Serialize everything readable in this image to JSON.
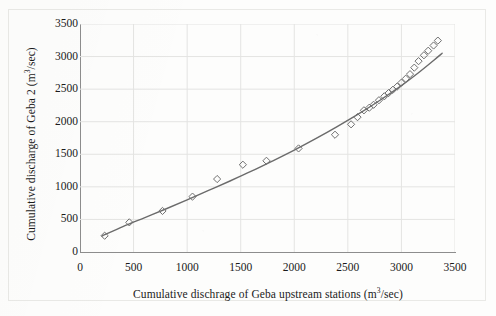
{
  "chart_data": {
    "type": "scatter",
    "title": "",
    "xlabel": "Cumulative dischrage of Geba upstream stations (m3/sec)",
    "ylabel": "Cumulative discharge of Geba 2  (m3/sec)",
    "xlabel_parts": {
      "pre": "Cumulative dischrage of Geba upstream stations (m",
      "sup": "3",
      "post": "/sec)"
    },
    "ylabel_parts": {
      "pre": "Cumulative discharge of Geba 2  (m",
      "sup": "3",
      "post": "/sec)"
    },
    "xlim": [
      0,
      3500
    ],
    "ylim": [
      0,
      3500
    ],
    "xticks": [
      0,
      500,
      1000,
      1500,
      2000,
      2500,
      3000,
      3500
    ],
    "yticks": [
      0,
      500,
      1000,
      1500,
      2000,
      2500,
      3000,
      3500
    ],
    "grid": true,
    "legend": "none",
    "marker": "open-diamond",
    "marker_color": "#6f6f6f",
    "line_color": "#6b6b6b",
    "series": [
      {
        "name": "Double mass points",
        "marker": "open-diamond",
        "points": [
          [
            230,
            250
          ],
          [
            460,
            455
          ],
          [
            770,
            630
          ],
          [
            1050,
            850
          ],
          [
            1280,
            1120
          ],
          [
            1520,
            1340
          ],
          [
            1740,
            1400
          ],
          [
            2040,
            1590
          ],
          [
            2380,
            1800
          ],
          [
            2530,
            1960
          ],
          [
            2590,
            2070
          ],
          [
            2650,
            2175
          ],
          [
            2700,
            2215
          ],
          [
            2740,
            2260
          ],
          [
            2790,
            2330
          ],
          [
            2840,
            2390
          ],
          [
            2880,
            2440
          ],
          [
            2920,
            2490
          ],
          [
            2960,
            2540
          ],
          [
            3000,
            2600
          ],
          [
            3040,
            2660
          ],
          [
            3080,
            2730
          ],
          [
            3120,
            2830
          ],
          [
            3160,
            2930
          ],
          [
            3210,
            3020
          ],
          [
            3250,
            3090
          ],
          [
            3300,
            3170
          ],
          [
            3340,
            3245
          ]
        ]
      },
      {
        "name": "Fitted trend curve",
        "type": "line",
        "points": [
          [
            205,
            245
          ],
          [
            400,
            390
          ],
          [
            600,
            525
          ],
          [
            800,
            660
          ],
          [
            1000,
            800
          ],
          [
            1200,
            945
          ],
          [
            1400,
            1090
          ],
          [
            1600,
            1240
          ],
          [
            1800,
            1400
          ],
          [
            2000,
            1565
          ],
          [
            2200,
            1740
          ],
          [
            2400,
            1925
          ],
          [
            2600,
            2120
          ],
          [
            2800,
            2330
          ],
          [
            3000,
            2555
          ],
          [
            3150,
            2740
          ],
          [
            3300,
            2940
          ],
          [
            3380,
            3050
          ]
        ]
      }
    ]
  },
  "axes": {
    "plot_left_px": 80,
    "plot_top_px": 24,
    "plot_width_px": 375,
    "plot_height_px": 228
  }
}
